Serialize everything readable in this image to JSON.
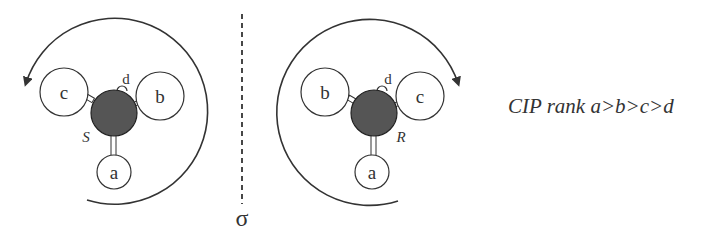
{
  "mirror": {
    "symbol": "σ"
  },
  "left_molecule": {
    "configuration": "S",
    "substituents": {
      "a": "a",
      "b": "b",
      "c": "c",
      "d": "d"
    },
    "rotation": "counterclockwise"
  },
  "right_molecule": {
    "configuration": "R",
    "substituents": {
      "a": "a",
      "b": "b",
      "c": "c",
      "d": "d"
    },
    "rotation": "clockwise"
  },
  "caption": "CIP rank a>b>c>d",
  "colors": {
    "stroke": "#333333",
    "center_atom": "#555555",
    "background": "#ffffff"
  }
}
